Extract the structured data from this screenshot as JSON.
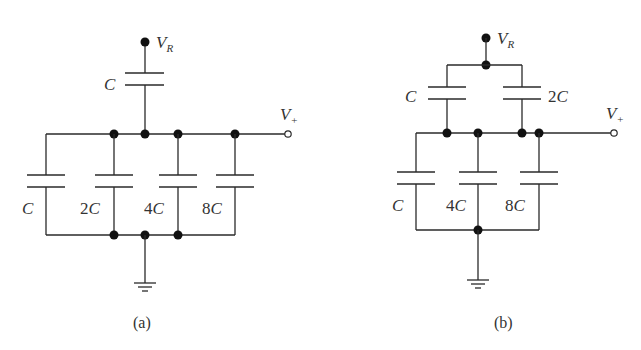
{
  "figure_a": {
    "caption": "(a)",
    "ref_node": {
      "main": "V",
      "sub": "R"
    },
    "out_node": {
      "main": "V",
      "sub": "+"
    },
    "top_cap": {
      "label": "C"
    },
    "caps": [
      {
        "coef": "",
        "sym": "C"
      },
      {
        "coef": "2",
        "sym": "C"
      },
      {
        "coef": "4",
        "sym": "C"
      },
      {
        "coef": "8",
        "sym": "C"
      }
    ]
  },
  "figure_b": {
    "caption": "(b)",
    "ref_node": {
      "main": "V",
      "sub": "R"
    },
    "out_node": {
      "main": "V",
      "sub": "+"
    },
    "top_caps": [
      {
        "coef": "",
        "sym": "C"
      },
      {
        "coef": "2",
        "sym": "C"
      }
    ],
    "caps": [
      {
        "coef": "",
        "sym": "C"
      },
      {
        "coef": "4",
        "sym": "C"
      },
      {
        "coef": "8",
        "sym": "C"
      }
    ]
  },
  "colors": {
    "wire": "#2a2a2a",
    "text": "#333333",
    "background": "#ffffff"
  }
}
